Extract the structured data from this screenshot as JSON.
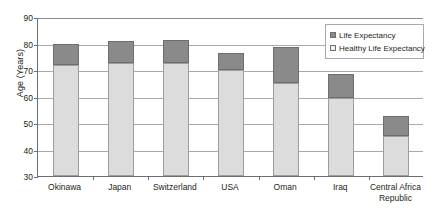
{
  "chart_data": {
    "type": "bar",
    "subtype": "stacked-bar",
    "title": "",
    "xlabel": "",
    "ylabel": "Age (Years)",
    "ylim": [
      30,
      90
    ],
    "yticks": [
      30,
      40,
      50,
      60,
      70,
      80,
      90
    ],
    "grid": true,
    "legend_position": "top-right",
    "categories": [
      "Okinawa",
      "Japan",
      "Switzerland",
      "USA",
      "Oman",
      "Iraq",
      "Central Africa Republic"
    ],
    "series": [
      {
        "name": "Healthy Life Expectancy",
        "color": "#dcdcdc",
        "values": [
          72,
          72.5,
          72.5,
          70,
          65,
          59.5,
          45
        ]
      },
      {
        "name": "Life Expectancy",
        "color": "#8a8a8a",
        "values": [
          80,
          81,
          81.3,
          76.5,
          78.5,
          68.5,
          52.5
        ]
      }
    ]
  },
  "axis": {
    "y_title": "Age (Years)",
    "y_tick_labels": [
      "90",
      "80",
      "70",
      "60",
      "50",
      "40",
      "30"
    ],
    "x_tick_labels": [
      [
        "Okinawa"
      ],
      [
        "Japan"
      ],
      [
        "Switzerland"
      ],
      [
        "USA"
      ],
      [
        "Oman"
      ],
      [
        "Iraq"
      ],
      [
        "Central Africa",
        "Republic"
      ]
    ]
  },
  "legend": {
    "items": [
      {
        "label": "Life Expectancy",
        "swatch": "dark"
      },
      {
        "label": "Healthy Life Expectancy",
        "swatch": "light"
      }
    ]
  },
  "colors": {
    "life_expectancy": "#8a8a8a",
    "healthy_life_expectancy": "#dcdcdc",
    "axis": "#6d6e71",
    "gridline": "#a7a9ac",
    "text": "#231f20",
    "background": "#ffffff"
  }
}
